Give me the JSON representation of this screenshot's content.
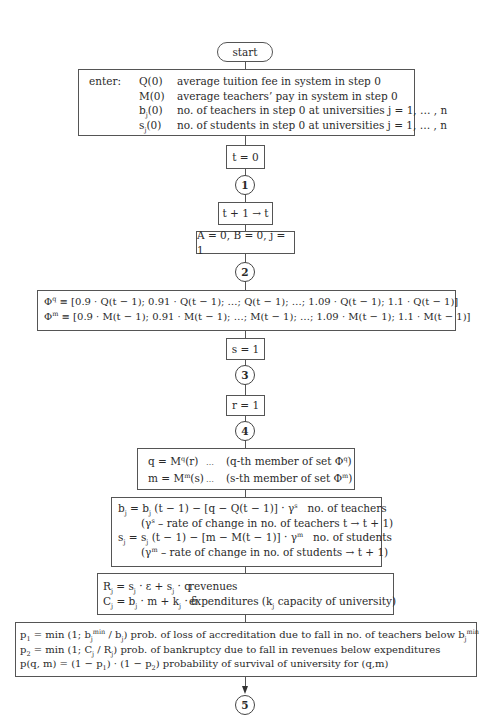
{
  "start": "start",
  "enter": {
    "label": "enter:",
    "rows": [
      {
        "sym": "Q(0)",
        "desc": "average tuition fee in system in step 0"
      },
      {
        "sym_base": "b",
        "sym": "M(0)",
        "desc": "average teachers’ pay in system in step 0"
      },
      {
        "sym_base": "b",
        "sym_sub": "j",
        "sym_tail": "(0)",
        "desc": "no. of teachers in step 0 at universities j = 1, … , n"
      },
      {
        "sym_base": "s",
        "sym_sub": "j",
        "sym_tail": "(0)",
        "desc": "no. of students in step 0 at universities j = 1, … , n"
      }
    ]
  },
  "t0": "t = 0",
  "connectors": [
    "1",
    "2",
    "3",
    "4",
    "5"
  ],
  "increment": "t + 1 → t",
  "init": "A = 0, B = 0, j = 1",
  "phi": {
    "q_sym": "Φ",
    "q_sup": "q",
    "q_text": " ≡ [0.9 · Q(t − 1); 0.91 · Q(t − 1); …; Q(t − 1); …; 1.09 · Q(t − 1);  1.1 · Q(t − 1)]",
    "m_sym": "Φ",
    "m_sup": "m",
    "m_text": " ≡ [0.9 · M(t − 1); 0.91 · M(t − 1); …; M(t − 1); …; 1.09 · M(t − 1);  1.1 · M(t − 1)]"
  },
  "s1": "s = 1",
  "r1": "r = 1",
  "select": {
    "q_lhs": "q  = M",
    "q_sup": "q",
    "q_arg": "(r)",
    "q_dots": "…",
    "q_note": "(q-th member of set Φ",
    "q_note_sup": "q",
    "m_lhs": "m = M",
    "m_sup": "m",
    "m_arg": "(s)",
    "m_dots": "…",
    "m_note": "(s-th member of set Φ",
    "m_note_sup": "m",
    "close": ")"
  },
  "update": {
    "b_lhs": "b",
    "b_rhs_a": " =  b",
    "b_rhs_b": " (t − 1) − [q − Q(t − 1)]  ·  γ",
    "b_gamma_sup": "s",
    "b_desc": "no. of teachers",
    "b_note_a": "(γ",
    "b_note_sup": "s",
    "b_note_b": " – rate of change in no. of teachers t → t + 1)",
    "s_lhs": "s",
    "s_rhs_a": " =  s",
    "s_rhs_b": " (t − 1) − [m − M(t − 1)] · γ",
    "s_gamma_sup": "m",
    "s_desc": "no. of students",
    "s_note_a": "(γ",
    "s_note_sup": "m",
    "s_note_b": " – rate of change in no. of students → t + 1)",
    "sub": "j"
  },
  "finance": {
    "r_formula_a": "R",
    "r_formula_b": " = s",
    "r_formula_c": " · ε + s",
    "r_formula_d": " · q",
    "r_label": "revenues",
    "c_formula_a": "C",
    "c_formula_b": " = b",
    "c_formula_c": " · m + k",
    "c_formula_d": " · δ",
    "c_label_a": "expenditures (k",
    "c_label_b": " capacity of university)",
    "sub": "j"
  },
  "prob": {
    "p1_a": "p",
    "p1_sub": "1",
    "p1_b": " = min (1; b",
    "p1_sup": "min",
    "p1_c": " / b",
    "p1_d": ") prob. of loss of accreditation due to fall in no. of teachers below  b",
    "p2_a": "p",
    "p2_sub": "2",
    "p2_b": " =  min (1; C",
    "p2_c": " / R",
    "p2_d": ") prob. of bankruptcy due to fall in revenues below expenditures",
    "p_text_a": "p(q, m) = (1 − p",
    "p_text_b": ") · (1 − p",
    "p_text_c": ") probability of survival of university for (q,m)",
    "sub_j": "j",
    "sub_1": "1",
    "sub_2": "2"
  }
}
